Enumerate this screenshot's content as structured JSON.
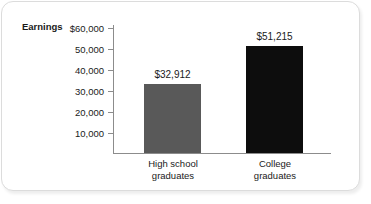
{
  "chart_data": {
    "type": "bar",
    "title": "",
    "xlabel": "",
    "ylabel": "Earnings",
    "categories": [
      "High school graduates",
      "College graduates"
    ],
    "values": [
      32912,
      51215
    ],
    "value_labels": [
      "$32,912",
      "$51,215"
    ],
    "ylim": [
      0,
      60000
    ],
    "y_ticks": [
      60000,
      50000,
      40000,
      30000,
      20000,
      10000
    ],
    "y_tick_labels": [
      "$60,000",
      "50,000",
      "40,000",
      "30,000",
      "20,000",
      "10,000"
    ],
    "grid": false,
    "legend": null,
    "bar_colors": [
      "#595959",
      "#0d0d0d"
    ]
  },
  "axis": {
    "y_title": "Earnings",
    "ticks": [
      {
        "label": "$60,000",
        "value": 60000
      },
      {
        "label": "50,000",
        "value": 50000
      },
      {
        "label": "40,000",
        "value": 40000
      },
      {
        "label": "30,000",
        "value": 30000
      },
      {
        "label": "20,000",
        "value": 20000
      },
      {
        "label": "10,000",
        "value": 10000
      }
    ]
  },
  "bars": [
    {
      "key": "high-school",
      "value_label": "$32,912",
      "category_line1": "High school",
      "category_line2": "graduates"
    },
    {
      "key": "college",
      "value_label": "$51,215",
      "category_line1": "College",
      "category_line2": "graduates"
    }
  ],
  "colors": {
    "bar_high_school": "#595959",
    "bar_college": "#0d0d0d",
    "axis": "#8c8c8c",
    "text": "#1a1a1a",
    "card_border": "#dcdcdc"
  }
}
